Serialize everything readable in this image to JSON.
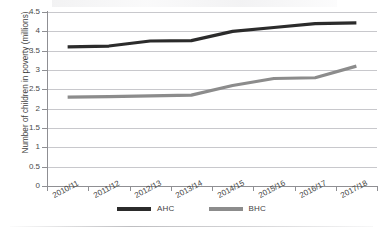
{
  "figure": {
    "background_color": "#ffffff",
    "grid_color": "#c8c8cc",
    "axis_color": "#8f8f93"
  },
  "yaxis": {
    "label": "Number of children in poverty (millions)",
    "ticks": [
      "0",
      "0.5",
      "1",
      "1.5",
      "2",
      "2.5",
      "3",
      "3.5",
      "4",
      "4.5"
    ]
  },
  "xaxis": {
    "label": "",
    "ticks": [
      "2010/11",
      "2011/12",
      "2012/13",
      "2013/14",
      "2014/15",
      "2015/16",
      "2016/17",
      "2017/18"
    ]
  },
  "legend": {
    "position": "bottom-center",
    "items": [
      {
        "label": "AHC",
        "color": "#2b2b2b"
      },
      {
        "label": "BHC",
        "color": "#8c8c8c"
      }
    ]
  },
  "chart_data": {
    "type": "line",
    "title": "",
    "subtitle": "",
    "xlabel": "",
    "ylabel": "Number of children in poverty (millions)",
    "categories": [
      "2010/11",
      "2011/12",
      "2012/13",
      "2013/14",
      "2014/15",
      "2015/16",
      "2016/17",
      "2017/18"
    ],
    "ylim": [
      0,
      4.5
    ],
    "ytick_step": 0.5,
    "grid": true,
    "legend_position": "bottom-center",
    "series": [
      {
        "name": "AHC",
        "color": "#2b2b2b",
        "linewidth": 3.2,
        "values": [
          3.6,
          3.62,
          3.75,
          3.76,
          4.0,
          4.1,
          4.2,
          4.22
        ]
      },
      {
        "name": "BHC",
        "color": "#8c8c8c",
        "linewidth": 3.2,
        "values": [
          2.3,
          2.31,
          2.33,
          2.35,
          2.6,
          2.78,
          2.8,
          3.1
        ]
      }
    ]
  }
}
